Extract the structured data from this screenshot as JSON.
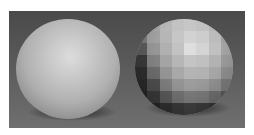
{
  "image": {
    "description": "Two rendered spheres comparing smooth shading and flat (faceted) shading on a gray background",
    "background_colors": {
      "top": "#4a4a4a",
      "bottom": "#6f6f6f",
      "border": "#ffffff"
    },
    "spheres": [
      {
        "name": "smooth-shaded-sphere",
        "shading": "smooth",
        "highlight": "#dcdcdc",
        "edge": "#3e3e3e"
      },
      {
        "name": "flat-shaded-sphere",
        "shading": "flat",
        "rows": 8,
        "cols": 8
      }
    ],
    "facet_shades": [
      [
        "#8a8a8a",
        "#a8a8a8",
        "#b8b8b8",
        "#c2c2c2",
        "#c6c6c6",
        "#c2c2c2",
        "#b4b4b4",
        "#9c9c9c"
      ],
      [
        "#7c7c7c",
        "#a2a2a2",
        "#b6b6b6",
        "#c6c6c6",
        "#d2d2d2",
        "#cdcdcd",
        "#bcbcbc",
        "#a2a2a2"
      ],
      [
        "#5c5c5c",
        "#969696",
        "#b0b0b0",
        "#c2c2c2",
        "#dedede",
        "#d4d4d4",
        "#c0c0c0",
        "#a4a4a4"
      ],
      [
        "#3a3a3a",
        "#828282",
        "#a4a4a4",
        "#b6b6b6",
        "#c4c4c4",
        "#c0c0c0",
        "#b2b2b2",
        "#9a9a9a"
      ],
      [
        "#2e2e2e",
        "#6c6c6c",
        "#949494",
        "#a8a8a8",
        "#b4b4b4",
        "#b2b2b2",
        "#a6a6a6",
        "#8e8e8e"
      ],
      [
        "#2a2a2a",
        "#4e4e4e",
        "#7e7e7e",
        "#949494",
        "#9c9c9c",
        "#9a9a9a",
        "#909090",
        "#7a7a7a"
      ],
      [
        "#262626",
        "#3a3a3a",
        "#5a5a5a",
        "#727272",
        "#7c7c7c",
        "#7a7a7a",
        "#6e6e6e",
        "#5a5a5a"
      ],
      [
        "#1e1e1e",
        "#262626",
        "#303030",
        "#3a3a3a",
        "#404040",
        "#3c3c3c",
        "#343434",
        "#2a2a2a"
      ]
    ]
  }
}
